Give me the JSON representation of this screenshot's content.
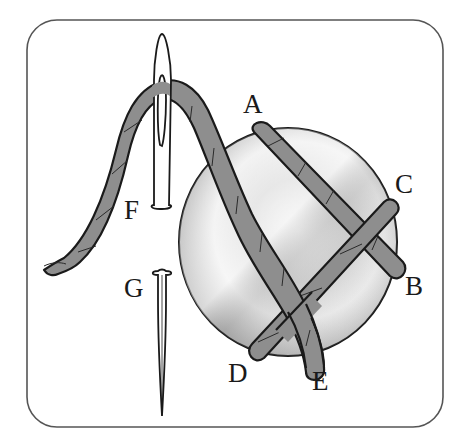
{
  "figure": {
    "frame": {
      "stroke": "#555555",
      "fill": "#ffffff"
    },
    "colors": {
      "thread": "#8e8e8e",
      "outline": "#1a1a1a",
      "button_light": "#f2f2f2",
      "button_dark": "#9a9a9a"
    },
    "labels": {
      "A": "A",
      "B": "B",
      "C": "C",
      "D": "D",
      "E": "E",
      "F": "F",
      "G": "G"
    },
    "parts": {
      "button": "button",
      "thread": "thread",
      "needle_eye": "needle eye (upper half)",
      "needle_point": "needle point (lower half)"
    }
  }
}
